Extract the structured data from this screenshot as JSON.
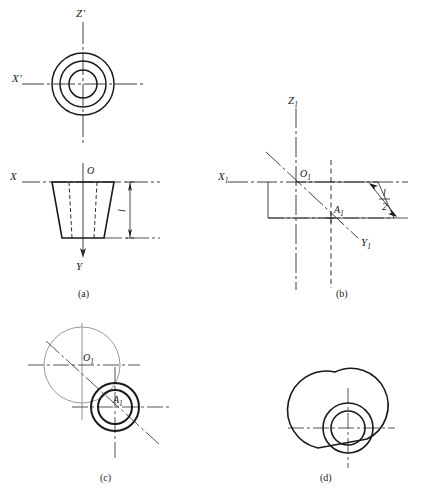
{
  "figure": {
    "stroke_color": "#1a1a1a",
    "background": "#ffffff",
    "panels": [
      {
        "id": "a",
        "caption": "(a)",
        "description": "Orthographic views: top view with three concentric circles on X'-Z' axes; front view showing trapezoidal section of frustum on X-Y axes with height dimension l",
        "axis_labels": [
          "X'",
          "Z'",
          "X",
          "Y"
        ],
        "point_labels": [
          "O"
        ],
        "dimension_labels": [
          "l"
        ],
        "circle_count": 3
      },
      {
        "id": "b",
        "caption": "(b)",
        "description": "Axonometric axes X1, Y1, Z1 with origin O1 and point A1 located at distance l/2 along the construction parallelogram",
        "axis_labels": [
          "X₁",
          "Y₁",
          "Z₁"
        ],
        "point_labels": [
          "O₁",
          "A₁"
        ],
        "dimension_labels": [
          "l/2"
        ],
        "fraction_numerator": "l",
        "fraction_denominator": "2"
      },
      {
        "id": "c",
        "caption": "(c)",
        "description": "Construction of ellipse-substitute circles: large base circle centered at O1 and two smaller concentric circles at A1",
        "axis_labels": [],
        "point_labels": [
          "O₁",
          "A₁"
        ],
        "dimension_labels": [],
        "circle_count": 3
      },
      {
        "id": "d",
        "caption": "(d)",
        "description": "Completed axonometric projection of the truncated cone with tangent outline connecting base and top circles",
        "axis_labels": [],
        "point_labels": [],
        "dimension_labels": [],
        "circle_count": 3
      }
    ]
  },
  "labels": {
    "x_prime": "X",
    "x_prime_mark": "'",
    "z_prime": "Z",
    "z_prime_mark": "'",
    "x_axis": "X",
    "y_axis": "Y",
    "origin_o": "O",
    "dim_l": "l",
    "x1": "X",
    "y1": "Y",
    "z1": "Z",
    "sub_1": "1",
    "o1": "O",
    "a1": "A",
    "half_num": "l",
    "half_den": "2"
  },
  "captions": {
    "a": "(a)",
    "b": "(b)",
    "c": "(c)",
    "d": "(d)"
  }
}
